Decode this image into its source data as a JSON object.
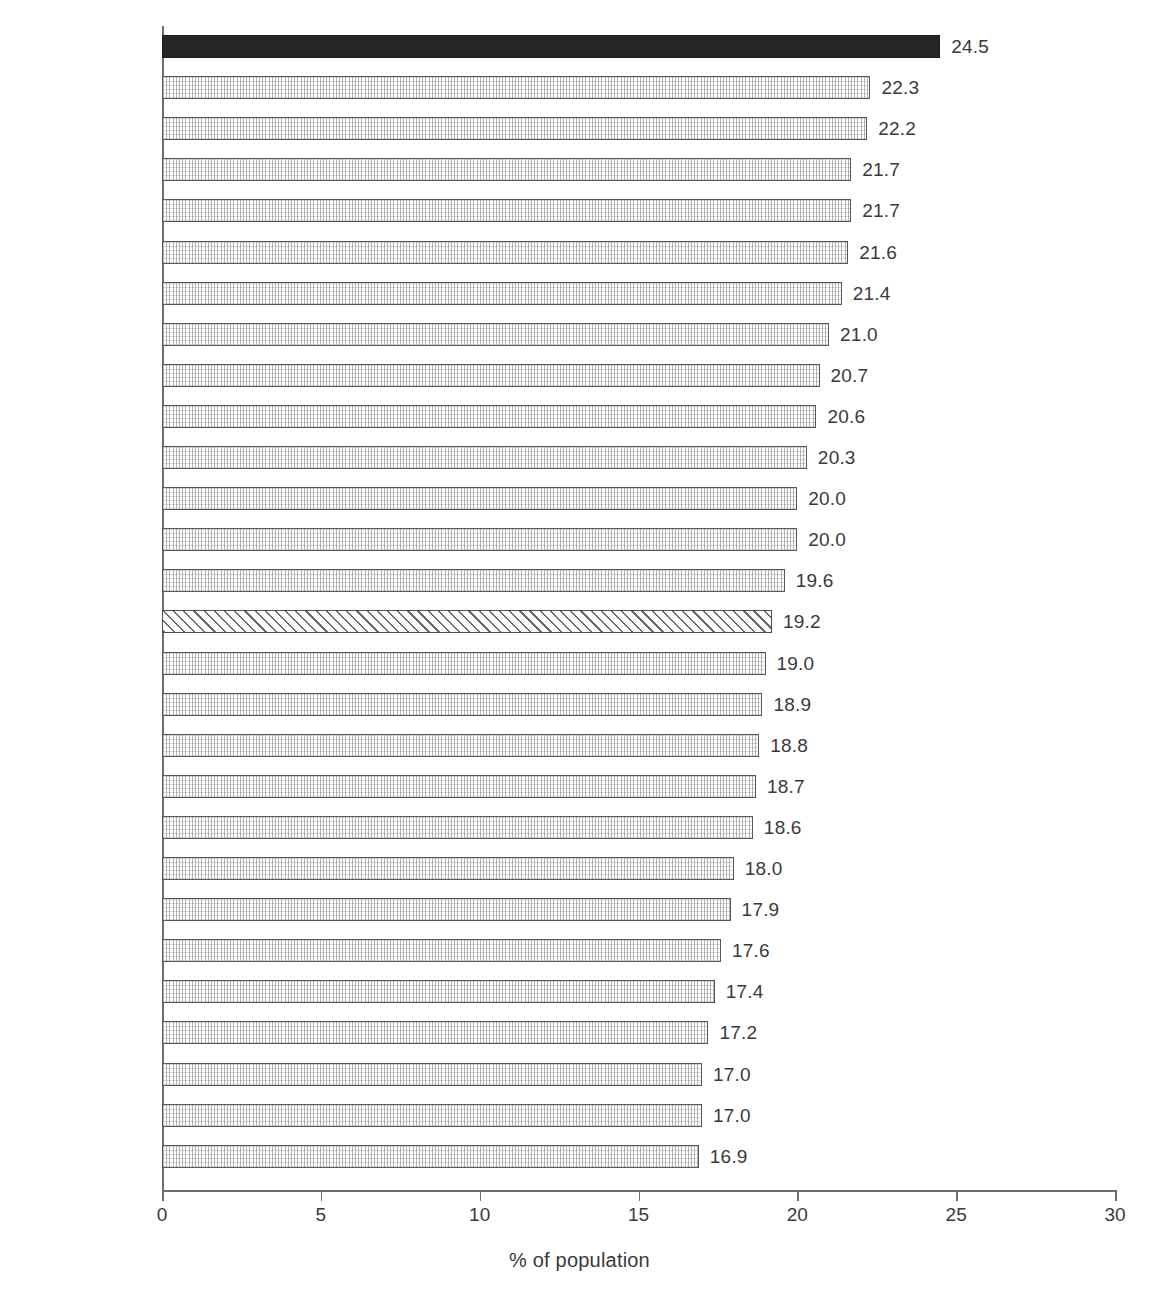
{
  "chart_data": {
    "type": "bar",
    "orientation": "horizontal",
    "title": "",
    "subtitle": "",
    "xlabel": "% of population",
    "ylabel": "",
    "xlim": [
      0,
      30
    ],
    "xticks": [
      0,
      5,
      10,
      15,
      20,
      25,
      30
    ],
    "xtick_labels": [
      "0",
      "5",
      "10",
      "15",
      "20",
      "25",
      "30"
    ],
    "grid": false,
    "legend": null,
    "categories": [
      "Ireland",
      "France",
      "Denmark",
      "Luxembourg",
      "Cyprus",
      "Netherlands",
      "United Kingdom",
      "Sweden",
      "Finland",
      "Belgium",
      "Malta",
      "Lithuania",
      "Slovakia",
      "Poland",
      "EU-27",
      "Austria",
      "Romania",
      "Estonia",
      "Hungary",
      "Portugal",
      "Latvia",
      "Czech Republic",
      "Spain",
      "Greece",
      "Slovenia",
      "Italy",
      "Germany",
      "Bulgaria"
    ],
    "values": [
      24.5,
      22.3,
      22.2,
      21.7,
      21.7,
      21.6,
      21.4,
      21.0,
      20.7,
      20.6,
      20.3,
      20.0,
      20.0,
      19.6,
      19.2,
      19.0,
      18.9,
      18.8,
      18.7,
      18.6,
      18.0,
      17.9,
      17.6,
      17.4,
      17.2,
      17.0,
      17.0,
      16.9
    ],
    "value_labels": [
      "24.5",
      "22.3",
      "22.2",
      "21.7",
      "21.7",
      "21.6",
      "21.4",
      "21.0",
      "20.7",
      "20.6",
      "20.3",
      "20.0",
      "20.0",
      "19.6",
      "19.2",
      "19.0",
      "18.9",
      "18.8",
      "18.7",
      "18.6",
      "18.0",
      "17.9",
      "17.6",
      "17.4",
      "17.2",
      "17.0",
      "17.0",
      "16.9"
    ],
    "bar_styles": [
      "solid",
      "grid",
      "grid",
      "grid",
      "grid",
      "grid",
      "grid",
      "grid",
      "grid",
      "grid",
      "grid",
      "grid",
      "grid",
      "grid",
      "diagonal",
      "grid",
      "grid",
      "grid",
      "grid",
      "grid",
      "grid",
      "grid",
      "grid",
      "grid",
      "grid",
      "grid",
      "grid",
      "grid"
    ],
    "highlight_category": "Ireland",
    "reference_category": "EU-27",
    "colors": {
      "highlight_fill": "#262626",
      "bar_fill": "#fdfdfd",
      "bar_border": "#585858",
      "reference_border": "#4f4f4f",
      "axis": "#6e6e6e",
      "text": "#3a3a3a",
      "background": "#ffffff"
    }
  }
}
